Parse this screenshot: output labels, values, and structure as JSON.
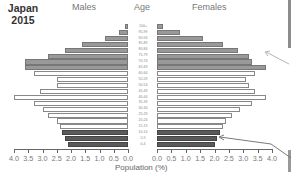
{
  "chart_data": {
    "type": "bar",
    "subtype": "population-pyramid",
    "title": "Japan 2015",
    "title_lines": [
      "Japan",
      "2015"
    ],
    "headers": {
      "left": "Males",
      "center": "Age",
      "right": "Females"
    },
    "xlabel": "Population (%)",
    "ylabel": "Age",
    "xlim": [
      0,
      4.0
    ],
    "x_ticks_left": [
      "4.0",
      "3.5",
      "3.0",
      "2.5",
      "2.0",
      "1.5",
      "1.0",
      "0.5",
      "0.0"
    ],
    "x_ticks_right": [
      "0.0",
      "0.5",
      "1.0",
      "1.5",
      "2.0",
      "2.5",
      "3.0",
      "3.5",
      "4.0"
    ],
    "grid": false,
    "categories": [
      "100+",
      "95-99",
      "90-94",
      "85-89",
      "80-84",
      "75-79",
      "70-74",
      "65-69",
      "60-64",
      "55-59",
      "50-54",
      "45-49",
      "40-44",
      "35-39",
      "30-34",
      "25-29",
      "20-24",
      "15-19",
      "10-14",
      "5-9",
      "0-4"
    ],
    "series": [
      {
        "name": "Males",
        "values": [
          0.1,
          0.3,
          0.8,
          1.6,
          2.2,
          2.8,
          3.6,
          3.6,
          3.3,
          2.5,
          2.5,
          3.1,
          4.0,
          3.3,
          3.0,
          2.8,
          2.5,
          2.4,
          2.3,
          2.2,
          2.1
        ]
      },
      {
        "name": "Females",
        "values": [
          0.2,
          0.8,
          1.6,
          2.3,
          2.8,
          3.2,
          3.3,
          3.8,
          3.4,
          3.1,
          3.2,
          3.4,
          3.8,
          3.3,
          2.9,
          2.6,
          2.4,
          2.3,
          2.2,
          2.1,
          2.0
        ]
      }
    ],
    "age_groups": {
      "old": {
        "range": "65+",
        "color": "#999999"
      },
      "working": {
        "range": "15-64",
        "color": "#ffffff"
      },
      "young": {
        "range": "0-14",
        "color": "#5a5a5a"
      }
    },
    "annotations": [
      {
        "type": "arrow",
        "target": "Females 65-69",
        "color": "#aaaaaa"
      },
      {
        "type": "arrow",
        "target": "Females 5-9",
        "color": "#777777"
      }
    ]
  }
}
